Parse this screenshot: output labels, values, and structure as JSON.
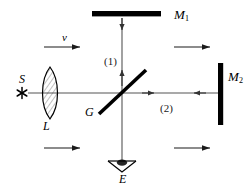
{
  "figure": {
    "background_color": "#ffffff",
    "ink_color": "#000000",
    "beam_color": "#555555",
    "width": 249,
    "height": 192
  },
  "labels": {
    "mirror_1": "M",
    "mirror_1_sub": "1",
    "mirror_2": "M",
    "mirror_2_sub": "2",
    "source": "S",
    "lens": "L",
    "beam_splitter": "G",
    "eye": "E",
    "velocity": "v",
    "beam_one": "(1)",
    "beam_two": "(2)"
  },
  "components": [
    {
      "name": "source",
      "label": "S",
      "type": "point-source-star",
      "x": 22,
      "y": 93
    },
    {
      "name": "lens",
      "label": "L",
      "type": "biconvex-lens",
      "x": 50,
      "y": 93
    },
    {
      "name": "beam-splitter",
      "label": "G",
      "type": "half-silvered-plate",
      "x": 122,
      "y": 93,
      "angle_deg": 45
    },
    {
      "name": "mirror-1",
      "label": "M1",
      "type": "plane-mirror-horizontal",
      "x": 122,
      "y": 15
    },
    {
      "name": "mirror-2",
      "label": "M2",
      "type": "plane-mirror-vertical",
      "x": 220,
      "y": 93
    },
    {
      "name": "eye",
      "label": "E",
      "type": "observer-eye",
      "x": 122,
      "y": 165
    }
  ],
  "beams": [
    {
      "name": "source-to-splitter",
      "from": "S",
      "to": "G",
      "direction": "right"
    },
    {
      "name": "beam-1",
      "label": "(1)",
      "from": "G",
      "to": "M1",
      "direction": "up"
    },
    {
      "name": "beam-2",
      "label": "(2)",
      "from": "G",
      "to": "M2",
      "direction": "right-and-back"
    },
    {
      "name": "splitter-to-eye",
      "from": "G",
      "to": "E",
      "direction": "down"
    }
  ],
  "motion_arrows": [
    {
      "name": "velocity-arrow-top-left",
      "label": "v",
      "direction": "right",
      "x": 48,
      "y": 47
    },
    {
      "name": "motion-arrow-top-right",
      "label": "",
      "direction": "right",
      "x": 178,
      "y": 47
    },
    {
      "name": "motion-arrow-bottom-left",
      "label": "",
      "direction": "right",
      "x": 48,
      "y": 148
    },
    {
      "name": "motion-arrow-bottom-right",
      "label": "",
      "direction": "right",
      "x": 178,
      "y": 148
    }
  ]
}
